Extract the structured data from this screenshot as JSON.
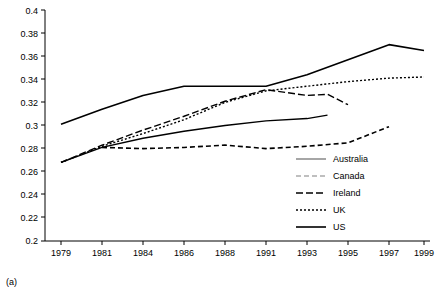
{
  "chart_data": {
    "type": "line",
    "title": "",
    "subtitle": "",
    "xlabel": "",
    "ylabel": "",
    "panel_label": "(a)",
    "grid": false,
    "legend_position": "right-inside",
    "x_ticks": [
      "1979",
      "1981",
      "1984",
      "1986",
      "1988",
      "1991",
      "1993",
      "1995",
      "1997",
      "1999"
    ],
    "y_ticks": [
      "0.2",
      "0.22",
      "0.24",
      "0.26",
      "0.28",
      "0.3",
      "0.32",
      "0.34",
      "0.36",
      "0.38",
      "0.4"
    ],
    "ylim": [
      0.2,
      0.4
    ],
    "x_categories": [
      1979,
      1981,
      1984,
      1986,
      1988,
      1991,
      1993,
      1995,
      1997,
      1999
    ],
    "series": [
      {
        "name": "Australia",
        "style": "solid-gray",
        "color": "#808080",
        "x": [
          1979,
          1981,
          1984,
          1986,
          1988,
          1991,
          1993,
          1994
        ],
        "values": [
          0.268,
          0.281,
          0.289,
          0.295,
          0.3,
          0.304,
          0.306,
          0.309
        ]
      },
      {
        "name": "Canada",
        "style": "dashed-gray",
        "color": "#aaaaaa",
        "x": [
          1981,
          1984,
          1986,
          1988,
          1991,
          1993,
          1995,
          1997
        ],
        "values": [
          0.281,
          0.28,
          0.281,
          0.283,
          0.28,
          0.282,
          0.285,
          0.299
        ]
      },
      {
        "name": "Ireland",
        "style": "long-dash-black",
        "color": "#000000",
        "x": [
          1979,
          1981,
          1984,
          1986,
          1988,
          1991,
          1993,
          1994,
          1995
        ],
        "values": [
          0.268,
          0.283,
          0.296,
          0.308,
          0.321,
          0.331,
          0.326,
          0.327,
          0.318
        ]
      },
      {
        "name": "UK",
        "style": "dotted-black",
        "color": "#000000",
        "x": [
          1979,
          1981,
          1984,
          1986,
          1988,
          1991,
          1993,
          1995,
          1997,
          1999
        ],
        "values": [
          0.268,
          0.282,
          0.293,
          0.305,
          0.32,
          0.33,
          0.334,
          0.338,
          0.341,
          0.342
        ]
      },
      {
        "name": "US",
        "style": "solid-black",
        "color": "#000000",
        "x": [
          1979,
          1981,
          1984,
          1986,
          1988,
          1991,
          1993,
          1995,
          1997,
          1999
        ],
        "values": [
          0.301,
          0.314,
          0.326,
          0.334,
          0.334,
          0.334,
          0.344,
          0.357,
          0.37,
          0.365
        ]
      }
    ],
    "legend": [
      {
        "label": "Australia",
        "style": "solid-gray"
      },
      {
        "label": "Canada",
        "style": "dashed-gray"
      },
      {
        "label": "Ireland",
        "style": "long-dash-black"
      },
      {
        "label": "UK",
        "style": "dotted-black"
      },
      {
        "label": "US",
        "style": "solid-black"
      }
    ]
  }
}
